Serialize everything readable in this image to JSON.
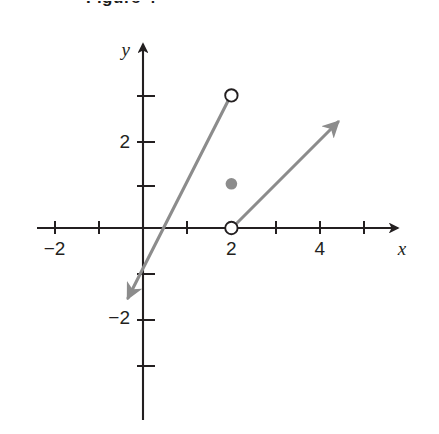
{
  "figure": {
    "caption": "Figure 4",
    "kind": "coordinate-plane-graph"
  },
  "chart_data": {
    "type": "line",
    "title": "Figure 4",
    "xlabel": "x",
    "ylabel": "y",
    "xlim": [
      -2.4,
      5.8
    ],
    "ylim": [
      -4.2,
      4.3
    ],
    "grid": false,
    "legend": null,
    "x_tick_labels": [
      "-2",
      "2",
      "4"
    ],
    "x_tick_values": [
      -2,
      2,
      4
    ],
    "x_ticks_all": [
      -2,
      -1,
      1,
      2,
      3,
      4,
      5
    ],
    "y_tick_labels": [
      "2",
      "-2"
    ],
    "y_tick_values": [
      2,
      -2
    ],
    "y_ticks_all": [
      3,
      2,
      1,
      -1,
      -2,
      -3
    ],
    "axis_arrows": [
      "x-positive",
      "y-positive"
    ],
    "series": [
      {
        "name": "steep-ray",
        "style": "ray",
        "color": "#8c8c8c",
        "from": [
          -0.35,
          -1.3
        ],
        "to": [
          2,
          3
        ],
        "arrow_at": "from",
        "endpoint_marker": "open-circle",
        "endpoint": [
          2,
          3
        ]
      },
      {
        "name": "shallow-ray",
        "style": "ray",
        "color": "#8c8c8c",
        "from": [
          2,
          0
        ],
        "to": [
          4.5,
          2.5
        ],
        "arrow_at": "to",
        "endpoint_marker": "open-circle",
        "endpoint": [
          2,
          0
        ]
      }
    ],
    "points": [
      {
        "name": "open-point-top",
        "x": 2,
        "y": 3,
        "marker": "open",
        "color": "#231f20"
      },
      {
        "name": "filled-point",
        "x": 2,
        "y": 1,
        "marker": "filled",
        "color": "#8c8c8c"
      },
      {
        "name": "open-point-origin",
        "x": 2,
        "y": 0,
        "marker": "open",
        "color": "#231f20"
      }
    ],
    "colors": {
      "axis": "#231f20",
      "ray": "#8c8c8c",
      "text": "#231f20",
      "background": "#ffffff"
    }
  }
}
